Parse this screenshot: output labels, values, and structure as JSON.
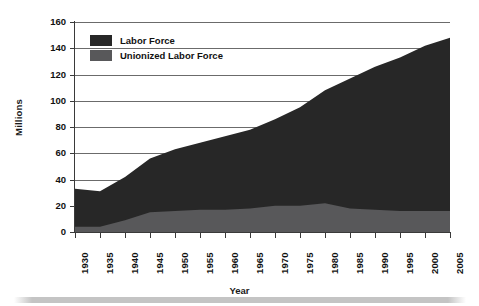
{
  "chart_data": {
    "type": "area",
    "title": "",
    "xlabel": "Year",
    "ylabel": "Millions",
    "xlim": [
      1930,
      2005
    ],
    "ylim": [
      0,
      160
    ],
    "grid": true,
    "legend_position": "top-left",
    "x": [
      1930,
      1935,
      1940,
      1945,
      1950,
      1955,
      1960,
      1965,
      1970,
      1975,
      1980,
      1985,
      1990,
      1995,
      2000,
      2005
    ],
    "xticklabels": [
      "1930",
      "1935",
      "1940",
      "1945",
      "1950",
      "1955",
      "1960",
      "1965",
      "1970",
      "1975",
      "1980",
      "1985",
      "1990",
      "1995",
      "2000",
      "2005"
    ],
    "yticklabels": [
      "0",
      "20",
      "40",
      "60",
      "80",
      "100",
      "120",
      "140",
      "160"
    ],
    "yticks": [
      0,
      20,
      40,
      60,
      80,
      100,
      120,
      140,
      160
    ],
    "series": [
      {
        "name": "Labor Force",
        "color": "#272727",
        "values": [
          33,
          31,
          42,
          56,
          63,
          68,
          73,
          78,
          86,
          95,
          108,
          117,
          126,
          133,
          142,
          148
        ]
      },
      {
        "name": "Unionized Labor Force",
        "color": "#58585a",
        "values": [
          4,
          4,
          9,
          15,
          16,
          17,
          17,
          18,
          20,
          20,
          22,
          18,
          17,
          16,
          16,
          16
        ]
      }
    ]
  },
  "legend": {
    "items": [
      {
        "label": "Labor Force",
        "color": "#272727"
      },
      {
        "label": "Unionized Labor Force",
        "color": "#58585a"
      }
    ]
  },
  "axes": {
    "y_title": "Millions",
    "x_title": "Year"
  }
}
